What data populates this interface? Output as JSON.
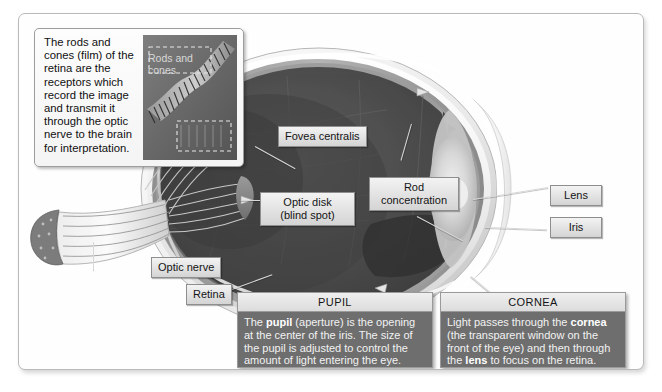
{
  "inset": {
    "name": "rods-and-cones-inset",
    "text": "The rods and cones (film) of the retina are the receptors which record the image and transmit it through the optic nerve to the brain for interpretation.",
    "photo_label": "Rods and cones"
  },
  "labels": [
    {
      "id": "fovea-centralis",
      "text": "Fovea centralis"
    },
    {
      "id": "optic-disk",
      "text": "Optic disk\n(blind spot)",
      "line1": "Optic disk",
      "line2": "(blind spot)"
    },
    {
      "id": "rod-concentration",
      "text": "Rod concentration",
      "line1": "Rod",
      "line2": "concentration"
    },
    {
      "id": "optic-nerve",
      "text": "Optic nerve"
    },
    {
      "id": "retina",
      "text": "Retina"
    },
    {
      "id": "lens",
      "text": "Lens"
    },
    {
      "id": "iris",
      "text": "Iris"
    }
  ],
  "panels": [
    {
      "id": "pupil",
      "title": "PUPIL",
      "body_html": "The <b>pupil</b> (aperture) is the opening at the center of the iris. The size of the pupil is adjusted to control the amount of light entering the eye.",
      "body_text": "The pupil (aperture) is the opening at the center of the iris. The size of the pupil is adjusted to control the amount of light entering the eye."
    },
    {
      "id": "cornea",
      "title": "CORNEA",
      "body_html": "Light passes through the <b>cornea</b> (the transparent window on the front of the eye) and then through the <b>lens</b> to focus on the retina.",
      "body_text": "Light passes through the cornea (the transparent window on the front of the eye) and then through the lens to focus on the retina."
    }
  ],
  "colors": {
    "page_background": "#ffffff",
    "frame_background": "#fefefe",
    "frame_border": "#b9b9b9",
    "label_fill": "#e2e2e2",
    "label_border": "#8e8e8e",
    "panel_body_background": "#6e6e6e",
    "panel_title_background": "#e4e4e4",
    "vitreous_dark": "#4a4a4a",
    "sclera_white": "#f2f2f2",
    "lens_light": "#d9d9d9",
    "iris_mid": "#bdbdbd",
    "leader_line": "#d8d8d8"
  }
}
